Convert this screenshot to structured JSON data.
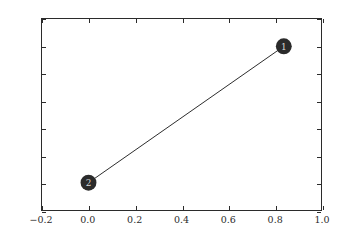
{
  "figure": {
    "background_color": "#ffffff",
    "axes_edge_color": "#2b2b2b",
    "title": "",
    "width_px": 340,
    "height_px": 241
  },
  "chart_data": {
    "type": "scatter",
    "title": "",
    "subtitle": "",
    "xlabel": "",
    "ylabel": "",
    "xlim": [
      -0.2,
      1.0
    ],
    "ylim": [
      -0.2,
      1.2
    ],
    "xticks": [
      -0.2,
      0.0,
      0.2,
      0.4,
      0.6,
      0.8,
      1.0
    ],
    "yticks": [
      -0.2,
      0.0,
      0.2,
      0.4,
      0.6,
      0.8,
      1.0,
      1.2
    ],
    "xticklabels": [
      "-0.2",
      "0.0",
      "0.2",
      "0.4",
      "0.6",
      "0.8",
      "1.0"
    ],
    "yticklabels": [
      "-0.2",
      "0.0",
      "0.2",
      "0.4",
      "0.6",
      "0.8",
      "1.0",
      "1.2"
    ],
    "grid": false,
    "legend": false,
    "legend_position": "none",
    "tick_direction": "in",
    "series": [
      {
        "name": "nodes",
        "marker": "circle",
        "marker_size_px": 16,
        "color": "#2b2b2b",
        "points": [
          {
            "label": "2",
            "x": 0.0,
            "y": 0.0
          },
          {
            "label": "1",
            "x": 0.84,
            "y": 1.0
          }
        ]
      },
      {
        "name": "edges",
        "type": "line",
        "color": "#2b2b2b",
        "linewidth_px": 1,
        "segments": [
          {
            "from": "2",
            "to": "1",
            "x": [
              0.0,
              0.84
            ],
            "y": [
              0.0,
              1.0
            ]
          }
        ]
      }
    ]
  }
}
